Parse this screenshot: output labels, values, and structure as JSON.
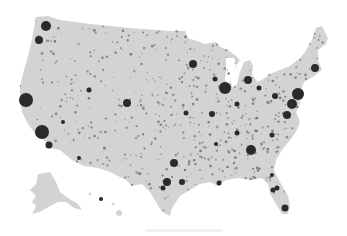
{
  "map": {
    "type": "proportional-symbol",
    "subject": "US population by county (dot map)",
    "land_color": "#d3d3d3",
    "dot_color": "#2a2a2a",
    "background": "#ffffff",
    "regions": [
      "contiguous-us",
      "alaska",
      "hawaii"
    ]
  },
  "cities": [
    {
      "name": "Seattle",
      "x": 46,
      "y": 26,
      "r": 5
    },
    {
      "name": "Portland",
      "x": 39,
      "y": 40,
      "r": 4
    },
    {
      "name": "San Francisco Bay",
      "x": 26,
      "y": 100,
      "r": 7
    },
    {
      "name": "Los Angeles",
      "x": 42,
      "y": 132,
      "r": 7
    },
    {
      "name": "San Diego",
      "x": 49,
      "y": 145,
      "r": 3.5
    },
    {
      "name": "Las Vegas",
      "x": 63,
      "y": 122,
      "r": 2
    },
    {
      "name": "Phoenix",
      "x": 79,
      "y": 158,
      "r": 2
    },
    {
      "name": "Salt Lake City",
      "x": 89,
      "y": 90,
      "r": 2.5
    },
    {
      "name": "Denver",
      "x": 127,
      "y": 103,
      "r": 4
    },
    {
      "name": "Minneapolis",
      "x": 193,
      "y": 64,
      "r": 4
    },
    {
      "name": "Chicago",
      "x": 225,
      "y": 88,
      "r": 6
    },
    {
      "name": "Milwaukee",
      "x": 215,
      "y": 79,
      "r": 2.5
    },
    {
      "name": "Detroit",
      "x": 248,
      "y": 80,
      "r": 4
    },
    {
      "name": "Cleveland",
      "x": 259,
      "y": 88,
      "r": 2.5
    },
    {
      "name": "Pittsburgh",
      "x": 275,
      "y": 96,
      "r": 3
    },
    {
      "name": "New York",
      "x": 298,
      "y": 94,
      "r": 6
    },
    {
      "name": "Philadelphia",
      "x": 292,
      "y": 104,
      "r": 5
    },
    {
      "name": "Boston",
      "x": 315,
      "y": 68,
      "r": 4
    },
    {
      "name": "Washington DC",
      "x": 287,
      "y": 115,
      "r": 4
    },
    {
      "name": "St. Louis",
      "x": 212,
      "y": 114,
      "r": 3
    },
    {
      "name": "Indianapolis",
      "x": 237,
      "y": 104,
      "r": 2.5
    },
    {
      "name": "Kansas City",
      "x": 186,
      "y": 113,
      "r": 2.5
    },
    {
      "name": "Atlanta",
      "x": 251,
      "y": 150,
      "r": 5
    },
    {
      "name": "Charlotte",
      "x": 272,
      "y": 135,
      "r": 2.5
    },
    {
      "name": "Dallas",
      "x": 174,
      "y": 163,
      "r": 4
    },
    {
      "name": "Houston",
      "x": 167,
      "y": 182,
      "r": 4
    },
    {
      "name": "San Antonio",
      "x": 163,
      "y": 188,
      "r": 2.5
    },
    {
      "name": "Austin",
      "x": 182,
      "y": 182,
      "r": 3
    },
    {
      "name": "New Orleans",
      "x": 219,
      "y": 183,
      "r": 2.5
    },
    {
      "name": "Miami",
      "x": 285,
      "y": 208,
      "r": 3.5
    },
    {
      "name": "Tampa",
      "x": 273,
      "y": 190,
      "r": 2.5
    },
    {
      "name": "Orlando",
      "x": 277,
      "y": 188,
      "r": 2.5
    },
    {
      "name": "Jacksonville",
      "x": 272,
      "y": 175,
      "r": 2
    },
    {
      "name": "Nashville",
      "x": 237,
      "y": 133,
      "r": 2.5
    },
    {
      "name": "Memphis",
      "x": 216,
      "y": 144,
      "r": 2
    },
    {
      "name": "Honolulu",
      "x": 101,
      "y": 199,
      "r": 2
    }
  ]
}
